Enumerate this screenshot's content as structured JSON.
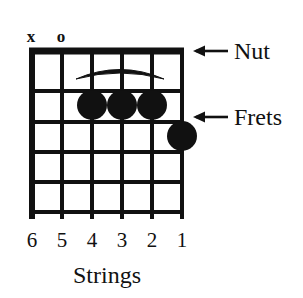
{
  "diagram": {
    "type": "guitar-chord-chart",
    "ink_color": "#111111",
    "background_color": "#ffffff",
    "strings_count": 6,
    "frets_count": 5,
    "caption": "Strings",
    "string_numbers": [
      "6",
      "5",
      "4",
      "3",
      "2",
      "1"
    ],
    "string_markers": [
      {
        "string": 6,
        "symbol": "x",
        "meaning": "muted"
      },
      {
        "string": 5,
        "symbol": "o",
        "meaning": "open"
      }
    ],
    "finger_dots": [
      {
        "string": 4,
        "fret": 2
      },
      {
        "string": 3,
        "fret": 2
      },
      {
        "string": 2,
        "fret": 2
      },
      {
        "string": 1,
        "fret": 3
      }
    ],
    "arc": {
      "present": true,
      "from_string": 5,
      "to_string": 1,
      "fret_space": 1,
      "meaning": "curved arc over first fret space"
    },
    "callouts": [
      {
        "label": "Nut",
        "arrow": "left-arrow",
        "points_to": "nut-line"
      },
      {
        "label": "Frets",
        "arrow": "left-arrow",
        "points_to": "fret-lines"
      }
    ]
  }
}
